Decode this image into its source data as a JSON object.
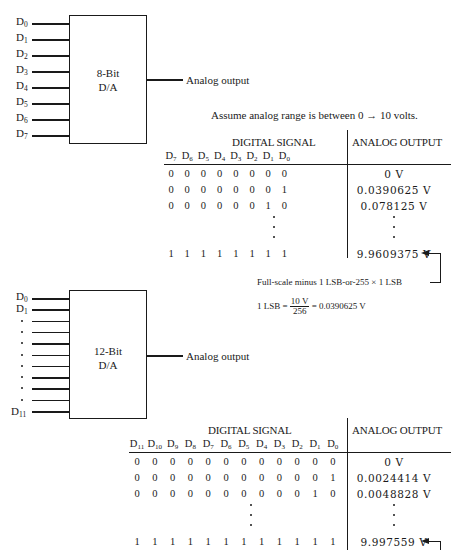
{
  "dac8": {
    "chip_label_line1": "8-Bit",
    "chip_label_line2": "D/A",
    "inputs": [
      "D",
      "D",
      "D",
      "D",
      "D",
      "D",
      "D",
      "D"
    ],
    "input_subs": [
      "0",
      "1",
      "2",
      "3",
      "4",
      "5",
      "6",
      "7"
    ],
    "output_label": "Analog output"
  },
  "assumption": "Assume analog range is between 0 → 10 volts.",
  "table8": {
    "digital_header": "DIGITAL SIGNAL",
    "analog_header": "ANALOG OUTPUT",
    "bit_headers": [
      "7",
      "6",
      "5",
      "4",
      "3",
      "2",
      "1",
      "0"
    ],
    "rows": [
      {
        "bits": [
          "0",
          "0",
          "0",
          "0",
          "0",
          "0",
          "0",
          "0"
        ],
        "value": "0 V"
      },
      {
        "bits": [
          "0",
          "0",
          "0",
          "0",
          "0",
          "0",
          "0",
          "1"
        ],
        "value": "0.0390625 V"
      },
      {
        "bits": [
          "0",
          "0",
          "0",
          "0",
          "0",
          "0",
          "1",
          "0"
        ],
        "value": "0.078125 V"
      },
      {
        "bits": [
          "1",
          "1",
          "1",
          "1",
          "1",
          "1",
          "1",
          "1"
        ],
        "value": "9.9609375 V"
      }
    ]
  },
  "annotation8": {
    "full_scale_note": "Full-scale minus 1 LSB-or-255 × 1 LSB",
    "lsb_prefix": "1 LSB =",
    "lsb_num": "10 V",
    "lsb_den": "256",
    "lsb_result": "= 0.0390625 V"
  },
  "dac12": {
    "chip_label_line1": "12-Bit",
    "chip_label_line2": "D/A",
    "first_inputs": [
      {
        "base": "D",
        "sub": "0"
      },
      {
        "base": "D",
        "sub": "1"
      }
    ],
    "last_input": {
      "base": "D",
      "sub": "11"
    },
    "output_label": "Analog output"
  },
  "table12": {
    "digital_header": "DIGITAL SIGNAL",
    "analog_header": "ANALOG OUTPUT",
    "bit_headers": [
      "11",
      "10",
      "9",
      "8",
      "7",
      "6",
      "5",
      "4",
      "3",
      "2",
      "1",
      "0"
    ],
    "rows": [
      {
        "bits": [
          "0",
          "0",
          "0",
          "0",
          "0",
          "0",
          "0",
          "0",
          "0",
          "0",
          "0",
          "0"
        ],
        "value": "0 V"
      },
      {
        "bits": [
          "0",
          "0",
          "0",
          "0",
          "0",
          "0",
          "0",
          "0",
          "0",
          "0",
          "0",
          "1"
        ],
        "value": "0.0024414 V"
      },
      {
        "bits": [
          "0",
          "0",
          "0",
          "0",
          "0",
          "0",
          "0",
          "0",
          "0",
          "0",
          "1",
          "0"
        ],
        "value": "0.0048828 V"
      },
      {
        "bits": [
          "1",
          "1",
          "1",
          "1",
          "1",
          "1",
          "1",
          "1",
          "1",
          "1",
          "1",
          "1"
        ],
        "value": "9.997559 V"
      }
    ]
  }
}
